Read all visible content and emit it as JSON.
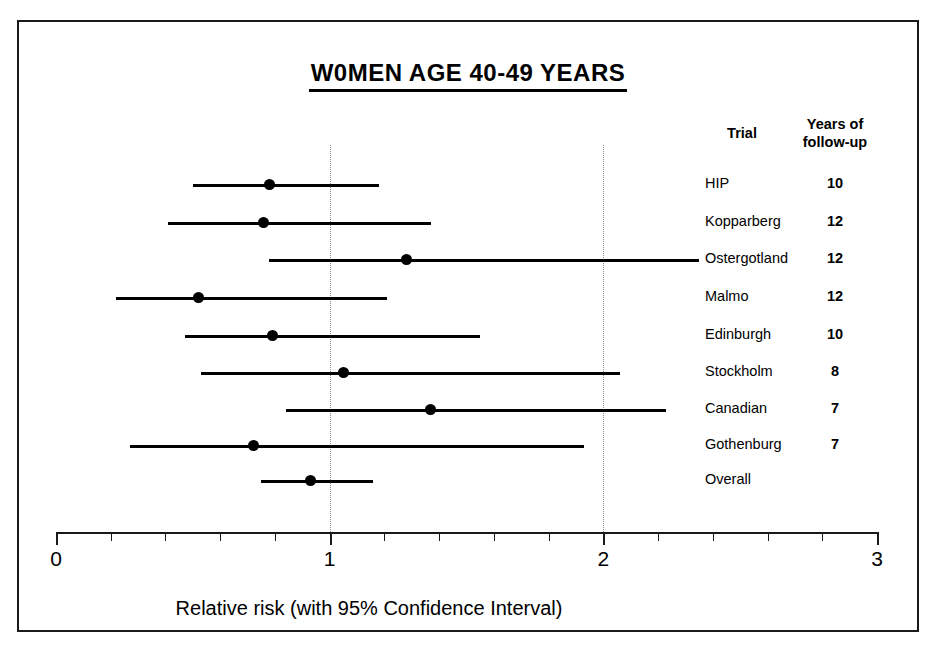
{
  "figure": {
    "title": "W0MEN AGE 40-49 YEARS",
    "xlabel": "Relative risk (with 95% Confidence Interval)"
  },
  "table_headers": {
    "trial": "Trial",
    "years_line1": "Years of",
    "years_line2": "follow-up"
  },
  "axis": {
    "ticks": [
      "0",
      "1",
      "2",
      "3"
    ]
  },
  "chart_data": {
    "type": "scatter",
    "title": "W0MEN AGE 40-49 YEARS",
    "xlabel": "Relative risk (with 95% Confidence Interval)",
    "ylabel": "",
    "xlim": [
      0,
      3
    ],
    "xticks": [
      0,
      1,
      2,
      3
    ],
    "xtick_labels": [
      "0",
      "1",
      "2",
      "3"
    ],
    "minor_tick_step": 0.2,
    "grid": "vertical dotted gridlines at 1 and 2",
    "reference_line": 1,
    "legend": "none",
    "columns": [
      "Trial",
      "Years of follow-up",
      "Relative risk",
      "95% CI lower",
      "95% CI upper"
    ],
    "rows": [
      {
        "trial": "HIP",
        "years": "10",
        "rr": 0.78,
        "ci_low": 0.5,
        "ci_high": 1.18
      },
      {
        "trial": "Kopparberg",
        "years": "12",
        "rr": 0.76,
        "ci_low": 0.41,
        "ci_high": 1.37
      },
      {
        "trial": "Ostergotland",
        "years": "12",
        "rr": 1.28,
        "ci_low": 0.78,
        "ci_high": 2.35
      },
      {
        "trial": "Malmo",
        "years": "12",
        "rr": 0.52,
        "ci_low": 0.22,
        "ci_high": 1.21
      },
      {
        "trial": "Edinburgh",
        "years": "10",
        "rr": 0.79,
        "ci_low": 0.47,
        "ci_high": 1.55
      },
      {
        "trial": "Stockholm",
        "years": "8",
        "rr": 1.05,
        "ci_low": 0.53,
        "ci_high": 2.06
      },
      {
        "trial": "Canadian",
        "years": "7",
        "rr": 1.37,
        "ci_low": 0.84,
        "ci_high": 2.23
      },
      {
        "trial": "Gothenburg",
        "years": "7",
        "rr": 0.72,
        "ci_low": 0.27,
        "ci_high": 1.93
      },
      {
        "trial": "Overall",
        "years": "",
        "rr": 0.93,
        "ci_low": 0.75,
        "ci_high": 1.16
      }
    ]
  }
}
